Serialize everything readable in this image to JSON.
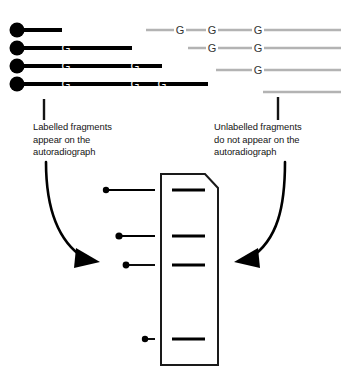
{
  "diagram": {
    "colors": {
      "labelled_fragment": "#000000",
      "unlabelled_fragment": "#b3b3b3",
      "base_letter_on_labelled": "#ffffff",
      "base_letter_on_unlabelled": "#333333",
      "gel_outline": "#1a1a1a",
      "gel_fill": "#ffffff",
      "band": "#000000",
      "arrow": "#000000",
      "text": "#141414",
      "background": "#ffffff"
    },
    "captions": {
      "left": "Labelled fragments\nappear on the\nautoradiograph",
      "right": "Unlabelled fragments\ndo not appear on the\nautoradiograph"
    },
    "labelled_fragments": {
      "group_label": "labelled-fragments-group",
      "marker": "radioactive-label-dot",
      "rows": [
        {
          "y": 30,
          "x_start": 10,
          "x_end": 62,
          "dot_cx": 17,
          "dot_r": 7.5,
          "bases": []
        },
        {
          "y": 48,
          "x_start": 10,
          "x_end": 132,
          "dot_cx": 17,
          "dot_r": 7.5,
          "bases": [
            {
              "letter": "G",
              "x": 66
            }
          ]
        },
        {
          "y": 66,
          "x_start": 10,
          "x_end": 162,
          "dot_cx": 17,
          "dot_r": 7.5,
          "bases": [
            {
              "letter": "G",
              "x": 66
            },
            {
              "letter": "G",
              "x": 135
            }
          ]
        },
        {
          "y": 84,
          "x_start": 10,
          "x_end": 208,
          "dot_cx": 17,
          "dot_r": 7.5,
          "bases": [
            {
              "letter": "G",
              "x": 66
            },
            {
              "letter": "G",
              "x": 135
            },
            {
              "letter": "G",
              "x": 162
            }
          ]
        }
      ]
    },
    "unlabelled_fragments": {
      "group_label": "unlabelled-fragments-group",
      "rows": [
        {
          "y": 30,
          "x_start": 146,
          "x_end": 341,
          "bases": [
            {
              "letter": "G",
              "x": 180
            },
            {
              "letter": "G",
              "x": 212
            },
            {
              "letter": "G",
              "x": 258
            }
          ]
        },
        {
          "y": 48,
          "x_start": 188,
          "x_end": 341,
          "bases": [
            {
              "letter": "G",
              "x": 212
            },
            {
              "letter": "G",
              "x": 258
            }
          ]
        },
        {
          "y": 70,
          "x_start": 216,
          "x_end": 341,
          "bases": [
            {
              "letter": "G",
              "x": 258
            }
          ]
        },
        {
          "y": 92,
          "x_start": 263,
          "x_end": 341,
          "bases": []
        }
      ]
    },
    "leader_ticks": [
      {
        "name": "leader-tick-left",
        "x": 44,
        "y_top": 99,
        "y_bottom": 120
      },
      {
        "name": "leader-tick-right",
        "x": 278,
        "y_top": 97,
        "y_bottom": 120
      }
    ],
    "arrows": [
      {
        "name": "arrow-labelled-to-gel",
        "path": "M 46,162 C 46,206 56,240 84,258",
        "head": "M 76,248 L 100,262 L 74,268 Z",
        "direction": "down-right"
      },
      {
        "name": "arrow-unlabelled-to-gel",
        "path": "M 285,162 C 285,206 278,240 250,258",
        "head": "M 258,248 L 234,262 L 260,268 Z",
        "direction": "down-left"
      }
    ],
    "gel": {
      "name": "autoradiograph-gel",
      "outline": "M 161,174 L 205,174 L 218,188 L 218,365 L 161,365 Z",
      "bands": [
        {
          "name": "gel-band-1",
          "x1": 172,
          "x2": 205,
          "y": 190
        },
        {
          "name": "gel-band-2",
          "x1": 172,
          "x2": 205,
          "y": 236
        },
        {
          "name": "gel-band-3",
          "x1": 172,
          "x2": 205,
          "y": 265
        },
        {
          "name": "gel-band-4",
          "x1": 172,
          "x2": 205,
          "y": 339
        }
      ]
    },
    "gel_pointer_fragments": [
      {
        "name": "pointer-fragment-1",
        "y": 190,
        "dot_cx": 106,
        "dot_r": 3.2,
        "x_end": 155
      },
      {
        "name": "pointer-fragment-2",
        "y": 236,
        "dot_cx": 119,
        "dot_r": 3.6,
        "x_end": 155
      },
      {
        "name": "pointer-fragment-3",
        "y": 265,
        "dot_cx": 126,
        "dot_r": 3.4,
        "x_end": 155
      },
      {
        "name": "pointer-fragment-4",
        "y": 339,
        "dot_cx": 145,
        "dot_r": 3.2,
        "x_end": 155
      }
    ]
  }
}
